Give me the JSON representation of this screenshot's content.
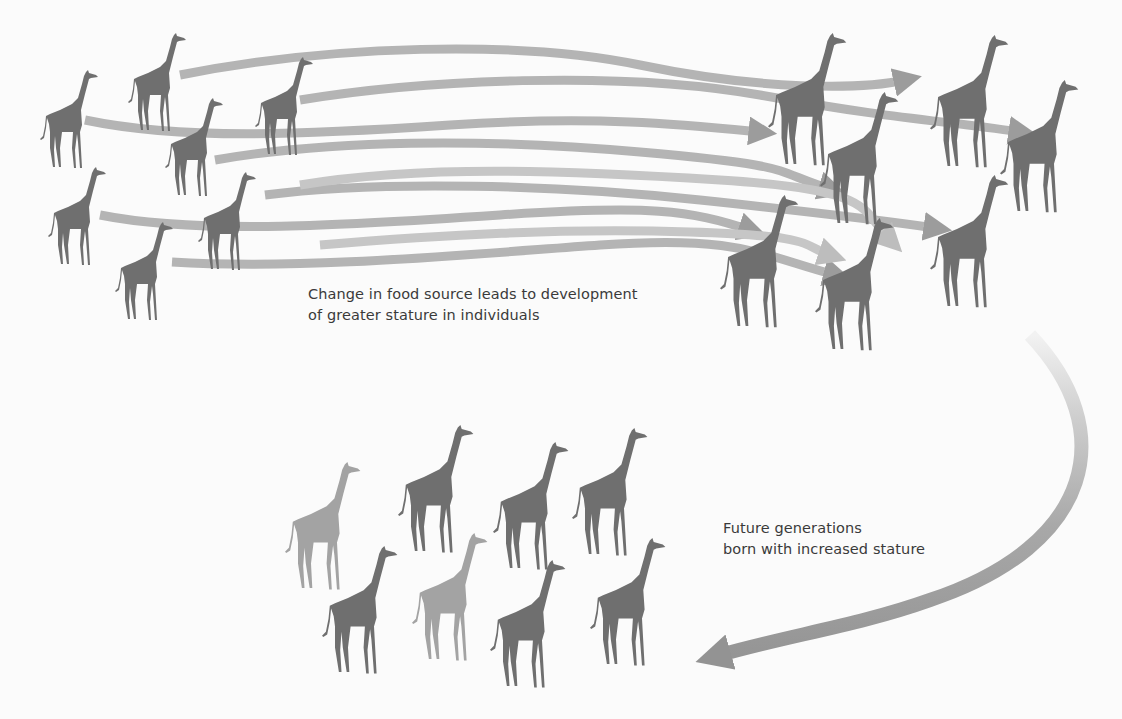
{
  "diagram": {
    "title": "",
    "colors": {
      "background": "#fbfbfb",
      "giraffe": "#6f6f6f",
      "giraffe_light": "#a3a3a3",
      "arrow": "#b4b4b4",
      "arrow_dark": "#8f8f8f",
      "text": "#3a3a3a"
    },
    "captions": {
      "change": {
        "line1": "Change in food source leads to development",
        "line2": "of greater stature in individuals"
      },
      "future": {
        "line1": "Future generations",
        "line2": "born with increased stature"
      }
    },
    "groups": [
      {
        "id": "original-population",
        "label": "Original individuals",
        "giraffes": [
          {
            "x": 40,
            "y": 70,
            "h": 100,
            "shade": "dark"
          },
          {
            "x": 128,
            "y": 33,
            "h": 100,
            "shade": "dark"
          },
          {
            "x": 165,
            "y": 98,
            "h": 100,
            "shade": "dark"
          },
          {
            "x": 255,
            "y": 57,
            "h": 100,
            "shade": "dark"
          },
          {
            "x": 48,
            "y": 167,
            "h": 100,
            "shade": "dark"
          },
          {
            "x": 198,
            "y": 172,
            "h": 100,
            "shade": "dark"
          },
          {
            "x": 115,
            "y": 222,
            "h": 100,
            "shade": "dark"
          }
        ]
      },
      {
        "id": "taller-individuals",
        "label": "Individuals with greater stature",
        "giraffes": [
          {
            "x": 768,
            "y": 33,
            "h": 135,
            "shade": "dark"
          },
          {
            "x": 930,
            "y": 35,
            "h": 135,
            "shade": "dark"
          },
          {
            "x": 1000,
            "y": 80,
            "h": 135,
            "shade": "dark"
          },
          {
            "x": 820,
            "y": 92,
            "h": 135,
            "shade": "dark"
          },
          {
            "x": 930,
            "y": 175,
            "h": 135,
            "shade": "dark"
          },
          {
            "x": 720,
            "y": 195,
            "h": 135,
            "shade": "dark"
          },
          {
            "x": 815,
            "y": 218,
            "h": 135,
            "shade": "dark"
          }
        ]
      },
      {
        "id": "future-generations",
        "label": "Future generations",
        "giraffes": [
          {
            "x": 285,
            "y": 462,
            "h": 130,
            "shade": "light"
          },
          {
            "x": 398,
            "y": 425,
            "h": 130,
            "shade": "dark"
          },
          {
            "x": 493,
            "y": 442,
            "h": 130,
            "shade": "dark"
          },
          {
            "x": 572,
            "y": 428,
            "h": 130,
            "shade": "dark"
          },
          {
            "x": 322,
            "y": 546,
            "h": 130,
            "shade": "dark"
          },
          {
            "x": 412,
            "y": 533,
            "h": 130,
            "shade": "light"
          },
          {
            "x": 490,
            "y": 560,
            "h": 130,
            "shade": "dark"
          },
          {
            "x": 590,
            "y": 538,
            "h": 130,
            "shade": "dark"
          }
        ]
      }
    ],
    "arrows": [
      {
        "d": "M180,75 C330,45 520,40 640,65 S860,90 905,80",
        "shade": "dark"
      },
      {
        "d": "M300,100 C420,80 620,70 760,95 S940,120 1020,132",
        "shade": "dark"
      },
      {
        "d": "M85,120 C180,140 300,135 450,125 S690,125 760,132",
        "shade": "dark"
      },
      {
        "d": "M215,160 C330,140 480,138 640,152 S770,170 830,189",
        "shade": "dark"
      },
      {
        "d": "M265,195 C380,180 560,185 700,200 S880,220 935,228",
        "shade": "dark"
      },
      {
        "d": "M100,215 C200,235 350,225 500,215 S690,210 750,230",
        "shade": "dark"
      },
      {
        "d": "M172,262 C300,270 460,255 600,245 S760,255 835,275",
        "shade": "dark"
      },
      {
        "d": "M300,185 C420,165 560,170 720,180 S860,210 890,240",
        "shade": "light"
      },
      {
        "d": "M320,245 C440,235 560,228 690,232 S800,245 830,255",
        "shade": "light"
      }
    ],
    "generation_arrow": {
      "d": "M1030,335 C1120,430 1095,545 930,600 C860,625 790,635 720,655",
      "label": "Inheritance arrow"
    }
  }
}
